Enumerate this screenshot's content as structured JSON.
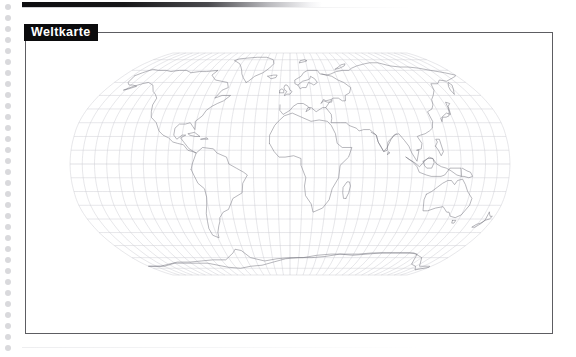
{
  "page": {
    "title_tag": "Weltkarte",
    "language": "de",
    "background_color": "#ffffff",
    "top_rule_color": "#0d0d0f",
    "frame_border_color": "#5d5d62",
    "punch_dot_color": "#d9d9dc",
    "punch_dot_count": 32,
    "punch_dot_spacing_px": 11
  },
  "map": {
    "label": "Weltkarte",
    "projection": "Robinson",
    "coastline_color": "#6b6b70",
    "graticule_color": "#c9c9cf",
    "graticule_spacing_deg": 10,
    "ocean_fill": "#ffffff",
    "land_fill": "#ffffff",
    "center_meridian_deg": 0,
    "lat_range": [
      -90,
      90
    ],
    "lon_range": [
      -180,
      180
    ],
    "frame": {
      "x": 25,
      "y": 32,
      "width": 528,
      "height": 302
    },
    "features": [
      "North America",
      "South America",
      "Europe",
      "Africa",
      "Asia",
      "Australia",
      "Antarctica",
      "Greenland",
      "Madagascar",
      "New Zealand",
      "Japan",
      "Indonesia",
      "Philippines",
      "British Isles",
      "Iceland"
    ]
  }
}
